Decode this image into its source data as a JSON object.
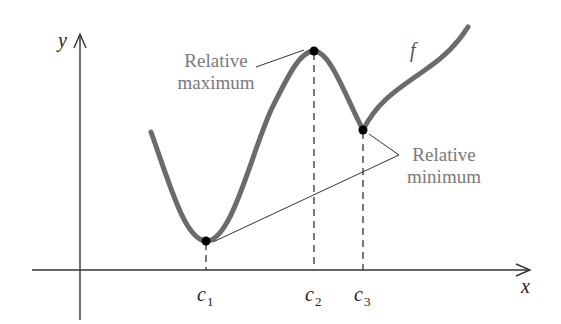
{
  "diagram": {
    "title": "",
    "axes": {
      "x_label": "x",
      "y_label": "y"
    },
    "function_label": "f",
    "tick_labels": [
      {
        "base": "c",
        "sub": "1"
      },
      {
        "base": "c",
        "sub": "2"
      },
      {
        "base": "c",
        "sub": "3"
      }
    ],
    "annotations": {
      "max_line1": "Relative",
      "max_line2": "maximum",
      "min_line1": "Relative",
      "min_line2": "minimum"
    },
    "points": [
      {
        "name": "c1",
        "type": "relative minimum"
      },
      {
        "name": "c2",
        "type": "relative maximum"
      },
      {
        "name": "c3",
        "type": "relative minimum"
      }
    ],
    "colors": {
      "curve": "#6b6b6b",
      "axes": "#333333",
      "points": "#000000",
      "annotation_text": "#7a7a7a"
    }
  }
}
